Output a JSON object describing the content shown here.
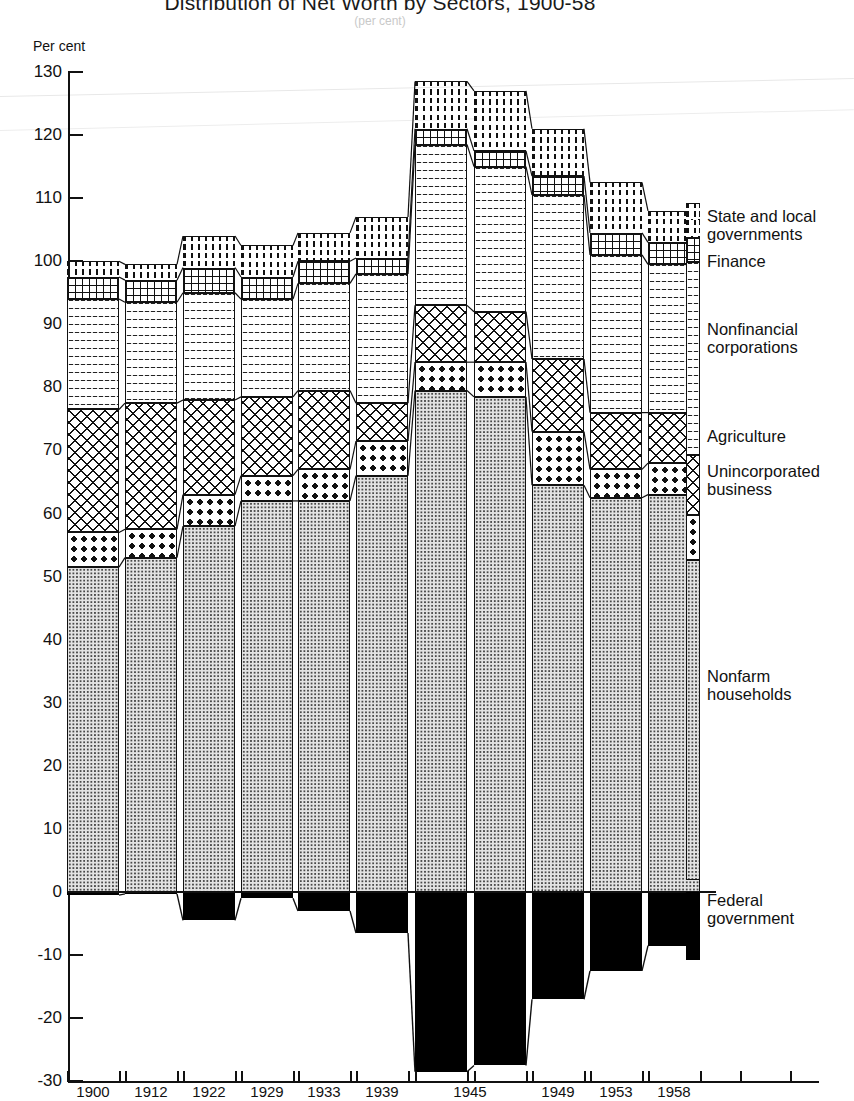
{
  "title": "Distribution of Net Worth by Sectors, 1900-58",
  "subtitle": "(per cent)",
  "axis": {
    "y_title": "Per cent",
    "y_ticks": [
      130,
      120,
      110,
      100,
      90,
      80,
      70,
      60,
      50,
      40,
      30,
      20,
      10,
      0,
      -10,
      -20,
      -30
    ],
    "y_min": -30,
    "y_max": 130
  },
  "legend": [
    {
      "key": "state",
      "label": "State and local\ngovernments",
      "top": 207
    },
    {
      "key": "finance",
      "label": "Finance",
      "top": 252
    },
    {
      "key": "nonfin",
      "label": "Nonfinancial\ncorporations",
      "top": 320
    },
    {
      "key": "agri",
      "label": "Agriculture",
      "top": 427
    },
    {
      "key": "uninc",
      "label": "Unincorporated\nbusiness",
      "top": 462
    },
    {
      "key": "nonfarm",
      "label": "Nonfarm\nhouseholds",
      "top": 667
    },
    {
      "key": "federal",
      "label": "Federal\ngovernment",
      "top": 891
    }
  ],
  "chart_data": {
    "type": "bar",
    "subtype": "stacked-column",
    "title": "Distribution of Net Worth by Sectors, 1900-58",
    "xlabel": "",
    "ylabel": "Per cent",
    "ylim": [
      -30,
      130
    ],
    "grid": false,
    "legend_position": "right",
    "categories": [
      "1900",
      "1912",
      "1922",
      "1929",
      "1933",
      "1939",
      "1943",
      "1945",
      "1949",
      "1953",
      "1958"
    ],
    "tick_labels": [
      "1900",
      "1912",
      "1922",
      "1929",
      "1933",
      "1939",
      "1945",
      "1949",
      "1953",
      "1958"
    ],
    "series": [
      {
        "name": "Nonfarm households",
        "values": [
          51.5,
          53.0,
          58.0,
          62.0,
          62.0,
          66.0,
          79.5,
          78.5,
          64.5,
          62.5,
          63.0
        ]
      },
      {
        "name": "Unincorporated business",
        "values": [
          5.5,
          4.5,
          5.0,
          4.0,
          5.0,
          5.5,
          4.5,
          5.5,
          8.5,
          4.5,
          5.0
        ]
      },
      {
        "name": "Agriculture",
        "values": [
          19.5,
          20.0,
          15.0,
          12.5,
          12.5,
          6.0,
          9.0,
          8.0,
          11.5,
          9.0,
          8.0
        ]
      },
      {
        "name": "Nonfinancial corporations",
        "values": [
          17.5,
          16.0,
          17.0,
          15.5,
          17.0,
          20.5,
          25.5,
          23.0,
          26.0,
          25.0,
          23.5
        ]
      },
      {
        "name": "Finance",
        "values": [
          3.5,
          3.5,
          4.0,
          3.5,
          3.5,
          2.5,
          2.5,
          2.5,
          3.0,
          3.5,
          3.5
        ]
      },
      {
        "name": "State and local governments",
        "values": [
          2.5,
          2.5,
          5.0,
          5.0,
          4.5,
          6.5,
          7.5,
          9.5,
          7.5,
          8.0,
          5.0
        ]
      },
      {
        "name": "Federal government",
        "values": [
          -0.5,
          -0.3,
          -4.5,
          -1.0,
          -3.0,
          -6.5,
          -28.5,
          -27.5,
          -17.0,
          -12.5,
          -8.5
        ]
      }
    ],
    "bar_totals_positive": [
      100.0,
      99.5,
      104.0,
      102.5,
      104.5,
      107.0,
      128.5,
      127.0,
      121.0,
      112.5,
      108.0
    ]
  }
}
